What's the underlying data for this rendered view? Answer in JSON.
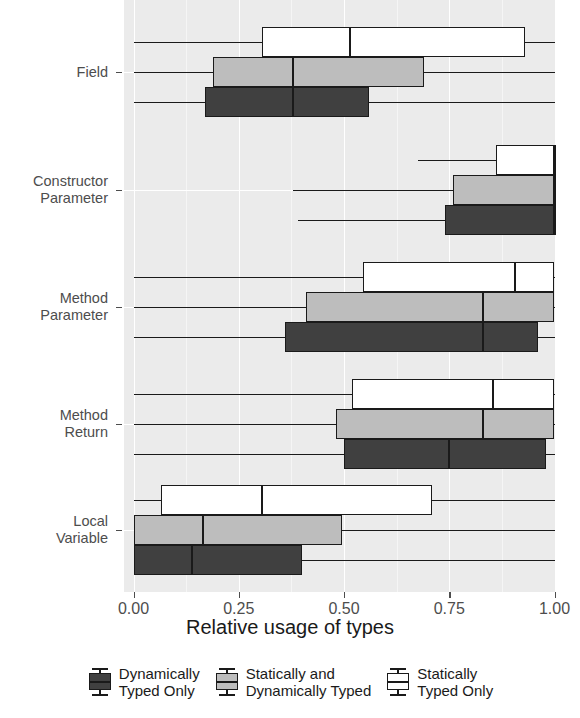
{
  "chart_data": {
    "type": "bar",
    "subtype": "grouped-horizontal-boxplot",
    "title": "",
    "xlabel": "Relative usage of types",
    "ylabel": "",
    "xlim": [
      0.0,
      1.0
    ],
    "xticks": [
      0.0,
      0.25,
      0.5,
      0.75,
      1.0
    ],
    "xticklabels": [
      "0.00",
      "0.25",
      "0.50",
      "0.75",
      "1.00"
    ],
    "categories": [
      "Field",
      "Constructor\nParameter",
      "Method\nParameter",
      "Method\nReturn",
      "Local\nVariable"
    ],
    "grid": true,
    "legend_position": "bottom",
    "series": [
      {
        "name": "Dynamically Typed Only",
        "color": "#404040",
        "boxes": [
          {
            "category": "Field",
            "whisker_low": 0.0,
            "q1": 0.17,
            "median": 0.38,
            "q3": 0.56,
            "whisker_high": 1.0
          },
          {
            "category": "Constructor Parameter",
            "whisker_low": 0.39,
            "q1": 0.74,
            "median": 1.0,
            "q3": 1.0,
            "whisker_high": 1.0
          },
          {
            "category": "Method Parameter",
            "whisker_low": 0.0,
            "q1": 0.36,
            "median": 0.83,
            "q3": 0.96,
            "whisker_high": 1.0
          },
          {
            "category": "Method Return",
            "whisker_low": 0.0,
            "q1": 0.5,
            "median": 0.75,
            "q3": 0.98,
            "whisker_high": 1.0
          },
          {
            "category": "Local Variable",
            "whisker_low": 0.0,
            "q1": 0.0,
            "median": 0.14,
            "q3": 0.4,
            "whisker_high": 1.0
          }
        ]
      },
      {
        "name": "Statically and Dynamically Typed",
        "color": "#bdbdbd",
        "boxes": [
          {
            "category": "Field",
            "whisker_low": 0.0,
            "q1": 0.19,
            "median": 0.38,
            "q3": 0.69,
            "whisker_high": 1.0
          },
          {
            "category": "Constructor Parameter",
            "whisker_low": 0.38,
            "q1": 0.76,
            "median": 1.0,
            "q3": 1.0,
            "whisker_high": 1.0
          },
          {
            "category": "Method Parameter",
            "whisker_low": 0.0,
            "q1": 0.41,
            "median": 0.83,
            "q3": 1.0,
            "whisker_high": 1.0
          },
          {
            "category": "Method Return",
            "whisker_low": 0.0,
            "q1": 0.48,
            "median": 0.83,
            "q3": 1.0,
            "whisker_high": 1.0
          },
          {
            "category": "Local Variable",
            "whisker_low": 0.0,
            "q1": 0.0,
            "median": 0.165,
            "q3": 0.495,
            "whisker_high": 1.0
          }
        ]
      },
      {
        "name": "Statically Typed Only",
        "color": "#ffffff",
        "boxes": [
          {
            "category": "Field",
            "whisker_low": 0.0,
            "q1": 0.305,
            "median": 0.515,
            "q3": 0.93,
            "whisker_high": 1.0
          },
          {
            "category": "Constructor Parameter",
            "whisker_low": 0.675,
            "q1": 0.86,
            "median": 1.0,
            "q3": 1.0,
            "whisker_high": 1.0
          },
          {
            "category": "Method Parameter",
            "whisker_low": 0.0,
            "q1": 0.545,
            "median": 0.905,
            "q3": 1.0,
            "whisker_high": 1.0
          },
          {
            "category": "Method Return",
            "whisker_low": 0.0,
            "q1": 0.52,
            "median": 0.855,
            "q3": 1.0,
            "whisker_high": 1.0
          },
          {
            "category": "Local Variable",
            "whisker_low": 0.0,
            "q1": 0.065,
            "median": 0.305,
            "q3": 0.71,
            "whisker_high": 1.0
          }
        ]
      }
    ]
  },
  "axis": {
    "x_title": "Relative usage of types",
    "x_tick_labels": [
      "0.00",
      "0.25",
      "0.50",
      "0.75",
      "1.00"
    ],
    "y_tick_labels": [
      "Field",
      "Constructor\nParameter",
      "Method\nParameter",
      "Method\nReturn",
      "Local\nVariable"
    ]
  },
  "legend": {
    "items": [
      {
        "label": "Dynamically\nTyped Only",
        "swatch": "dark"
      },
      {
        "label": "Statically and\nDynamically Typed",
        "swatch": "gray"
      },
      {
        "label": "Statically\nTyped Only",
        "swatch": "white"
      }
    ]
  },
  "colors": {
    "panel_background": "#ebebeb",
    "grid_major": "#ffffff",
    "grid_minor": "#f5f5f5",
    "dark": "#404040",
    "gray": "#bdbdbd",
    "white": "#ffffff",
    "stroke": "#1a1a1a",
    "axis_text": "#4d4d4d"
  }
}
